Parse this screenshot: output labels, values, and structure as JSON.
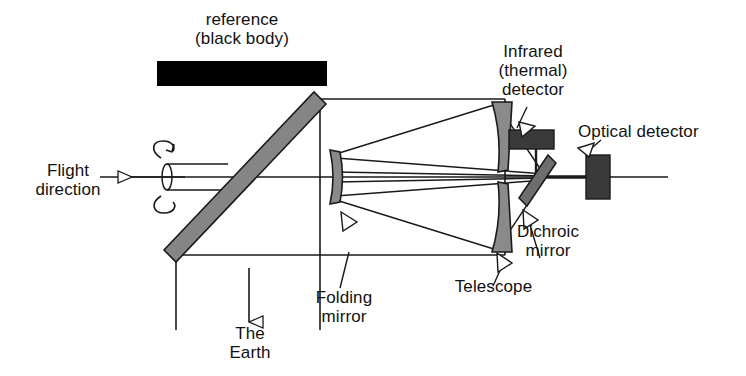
{
  "diagram": {
    "labels": {
      "reference": "reference\n(black body)",
      "flight_direction": "Flight\ndirection",
      "the_earth": "The\nEarth",
      "folding_mirror": "Folding\nmirror",
      "telescope": "Telescope",
      "dichroic_mirror": "Dichroic\nmirror",
      "infrared_detector": "Infrared\n(thermal)\ndetector",
      "optical_detector": "Optical detector"
    },
    "colors": {
      "black_body": "#000000",
      "mirror_gray": "#808080",
      "mirror_gray_dark": "#6e6e6e",
      "detector_dark": "#3a3a3a",
      "line": "#1a1a1a",
      "arrow_fill": "#ffffff",
      "background": "#ffffff"
    },
    "components": [
      {
        "name": "black-body-reference",
        "type": "rect",
        "shade": "black"
      },
      {
        "name": "scan-mirror",
        "type": "tilted-bar",
        "shade": "gray"
      },
      {
        "name": "rotation-indicator",
        "type": "cylinder-with-circular-arrow"
      },
      {
        "name": "folding-mirror",
        "type": "curved-mirror",
        "shade": "gray"
      },
      {
        "name": "telescope-primary-upper",
        "type": "curved-mirror",
        "shade": "gray"
      },
      {
        "name": "telescope-primary-lower",
        "type": "curved-mirror",
        "shade": "gray"
      },
      {
        "name": "dichroic-mirror",
        "type": "tilted-bar",
        "shade": "dark-gray"
      },
      {
        "name": "infrared-detector",
        "type": "rect",
        "shade": "dark"
      },
      {
        "name": "optical-detector",
        "type": "rect",
        "shade": "dark"
      },
      {
        "name": "optical-axis",
        "type": "line"
      },
      {
        "name": "ray-bundle",
        "type": "lines"
      },
      {
        "name": "instrument-frame",
        "type": "lines"
      }
    ]
  }
}
